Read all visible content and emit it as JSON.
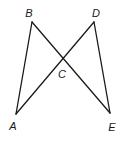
{
  "diagram": {
    "type": "geometry",
    "points": {
      "A": {
        "label": "A",
        "x": 16,
        "y": 114,
        "lx": 13,
        "ly": 126
      },
      "B": {
        "label": "B",
        "x": 32,
        "y": 22,
        "lx": 29,
        "ly": 13
      },
      "C": {
        "label": "C",
        "x": 62,
        "y": 59,
        "lx": 62,
        "ly": 74
      },
      "D": {
        "label": "D",
        "x": 94,
        "y": 22,
        "lx": 96,
        "ly": 13
      },
      "E": {
        "label": "E",
        "x": 110,
        "y": 113,
        "lx": 112,
        "ly": 127
      }
    },
    "segments": [
      {
        "from": "A",
        "to": "B"
      },
      {
        "from": "B",
        "to": "E"
      },
      {
        "from": "A",
        "to": "D"
      },
      {
        "from": "D",
        "to": "E"
      }
    ],
    "stroke_color": "#1a1a1a"
  }
}
